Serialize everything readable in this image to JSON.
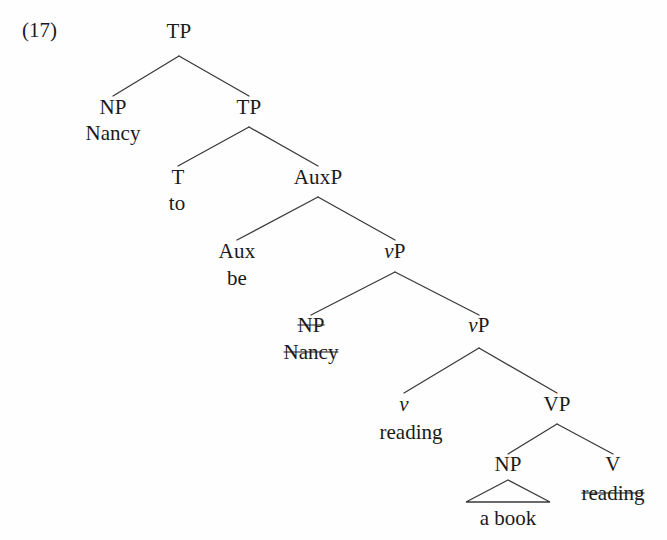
{
  "figure": {
    "example_number": "(17)",
    "type": "syntax-tree"
  },
  "tree": {
    "nodes": [
      {
        "id": "tp1",
        "label": "TP",
        "x": 179,
        "y": 31,
        "style": "plain",
        "name": "node-tp-root"
      },
      {
        "id": "np1",
        "label": "NP",
        "x": 113,
        "y": 107,
        "style": "plain",
        "name": "node-np-subject"
      },
      {
        "id": "tp2",
        "label": "TP",
        "x": 249,
        "y": 107,
        "style": "plain",
        "name": "node-tp-inner"
      },
      {
        "id": "t",
        "label": "T",
        "x": 178,
        "y": 177,
        "style": "plain",
        "name": "node-t"
      },
      {
        "id": "auxp",
        "label": "AuxP",
        "x": 318,
        "y": 177,
        "style": "plain",
        "name": "node-auxp"
      },
      {
        "id": "aux",
        "label": "Aux",
        "x": 237,
        "y": 251,
        "style": "plain",
        "name": "node-aux"
      },
      {
        "id": "vp1",
        "label": "vP",
        "x": 395,
        "y": 251,
        "style": "italic-v",
        "name": "node-vp-upper"
      },
      {
        "id": "np2",
        "label": "NP",
        "x": 311,
        "y": 325,
        "style": "struck",
        "name": "node-np-trace"
      },
      {
        "id": "vp2",
        "label": "vP",
        "x": 479,
        "y": 325,
        "style": "italic-v",
        "name": "node-vp-lower"
      },
      {
        "id": "v",
        "label": "v",
        "x": 404,
        "y": 404,
        "style": "italic",
        "name": "node-little-v"
      },
      {
        "id": "VP",
        "label": "VP",
        "x": 557,
        "y": 404,
        "style": "plain",
        "name": "node-vp-big"
      },
      {
        "id": "np3",
        "label": "NP",
        "x": 508,
        "y": 464,
        "style": "plain",
        "name": "node-np-object"
      },
      {
        "id": "bigv",
        "label": "V",
        "x": 613,
        "y": 464,
        "style": "plain",
        "name": "node-v-head"
      }
    ],
    "terminals": [
      {
        "id": "nancy1",
        "label": "Nancy",
        "x": 113,
        "y": 133,
        "style": "plain",
        "name": "terminal-nancy-subject"
      },
      {
        "id": "to",
        "label": "to",
        "x": 177,
        "y": 203,
        "style": "plain",
        "name": "terminal-to"
      },
      {
        "id": "be",
        "label": "be",
        "x": 237,
        "y": 278,
        "style": "plain",
        "name": "terminal-be"
      },
      {
        "id": "nancy2",
        "label": "Nancy",
        "x": 311,
        "y": 352,
        "style": "struck",
        "name": "terminal-nancy-trace"
      },
      {
        "id": "reading1",
        "label": "reading",
        "x": 411,
        "y": 432,
        "style": "plain",
        "name": "terminal-reading-little-v"
      },
      {
        "id": "abook",
        "label": "a book",
        "x": 508,
        "y": 518,
        "style": "plain",
        "name": "terminal-a-book"
      },
      {
        "id": "reading2",
        "label": "reading",
        "x": 613,
        "y": 493,
        "style": "struck",
        "name": "terminal-reading-struck"
      }
    ],
    "branches": [
      {
        "from": "tp1",
        "to": "np1",
        "apex_x": 179,
        "apex_y": 56,
        "end_x": 113,
        "end_y": 96,
        "name": "branch-tp-np"
      },
      {
        "from": "tp1",
        "to": "tp2",
        "apex_x": 179,
        "apex_y": 56,
        "end_x": 249,
        "end_y": 96,
        "name": "branch-tp-tp"
      },
      {
        "from": "tp2",
        "to": "t",
        "apex_x": 249,
        "apex_y": 127,
        "end_x": 178,
        "end_y": 166,
        "name": "branch-tp-t"
      },
      {
        "from": "tp2",
        "to": "auxp",
        "apex_x": 249,
        "apex_y": 127,
        "end_x": 318,
        "end_y": 166,
        "name": "branch-tp-auxp"
      },
      {
        "from": "auxp",
        "to": "aux",
        "apex_x": 318,
        "apex_y": 197,
        "end_x": 237,
        "end_y": 240,
        "name": "branch-auxp-aux"
      },
      {
        "from": "auxp",
        "to": "vp1",
        "apex_x": 318,
        "apex_y": 197,
        "end_x": 395,
        "end_y": 240,
        "name": "branch-auxp-vp"
      },
      {
        "from": "vp1",
        "to": "np2",
        "apex_x": 395,
        "apex_y": 272,
        "end_x": 311,
        "end_y": 315,
        "name": "branch-vp-np"
      },
      {
        "from": "vp1",
        "to": "vp2",
        "apex_x": 395,
        "apex_y": 272,
        "end_x": 479,
        "end_y": 315,
        "name": "branch-vp-vp"
      },
      {
        "from": "vp2",
        "to": "v",
        "apex_x": 479,
        "apex_y": 348,
        "end_x": 404,
        "end_y": 393,
        "name": "branch-vp-littlev"
      },
      {
        "from": "vp2",
        "to": "VP",
        "apex_x": 479,
        "apex_y": 348,
        "end_x": 557,
        "end_y": 393,
        "name": "branch-vp-bigvp"
      },
      {
        "from": "VP",
        "to": "np3",
        "apex_x": 557,
        "apex_y": 424,
        "end_x": 508,
        "end_y": 454,
        "name": "branch-vp-npobj"
      },
      {
        "from": "VP",
        "to": "bigv",
        "apex_x": 557,
        "apex_y": 424,
        "end_x": 613,
        "end_y": 454,
        "name": "branch-vp-v"
      }
    ],
    "triangle": {
      "apex_x": 508,
      "apex_y": 480,
      "left_x": 466,
      "right_x": 550,
      "base_y": 502,
      "name": "triangle-a-book"
    }
  },
  "colors": {
    "ink": "#1a1a1a",
    "line": "#3a3a3a",
    "background": "#fefefe"
  }
}
